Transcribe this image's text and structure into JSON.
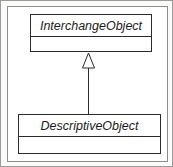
{
  "diagram": {
    "type": "uml-class-diagram",
    "notation": "UML",
    "relationship": "generalization",
    "classes": [
      {
        "id": "interchange-object",
        "name": "InterchangeObject",
        "role": "superclass",
        "abstract": true,
        "attributes": [],
        "operations": []
      },
      {
        "id": "descriptive-object",
        "name": "DescriptiveObject",
        "role": "subclass",
        "abstract": true,
        "attributes": [],
        "operations": []
      }
    ],
    "edges": [
      {
        "id": "generalization-edge",
        "kind": "generalization",
        "from": "descriptive-object",
        "to": "interchange-object",
        "label": "",
        "arrowhead": "hollow-triangle"
      }
    ],
    "colors": {
      "stroke": "#2b2b2b",
      "fill": "#ffffff",
      "frame": "#8d8d8d",
      "page": "#fbfbfa"
    }
  }
}
